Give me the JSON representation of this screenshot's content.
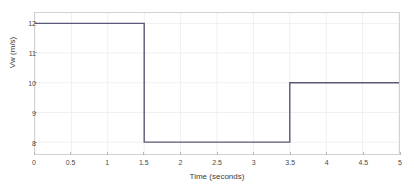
{
  "chart_data": {
    "type": "line",
    "title": "",
    "subtitle": "",
    "xlabel": "Time (seconds)",
    "ylabel": "Vw (m/s)",
    "xlim": [
      0,
      5
    ],
    "ylim": [
      7.6,
      12.35
    ],
    "xticks": [
      0,
      0.5,
      1,
      1.5,
      2,
      2.5,
      3,
      3.5,
      4,
      4.5,
      5
    ],
    "xticklabels": [
      "0",
      "0.5",
      "1",
      "1.5",
      "2",
      "2.5",
      "3",
      "3.5",
      "4",
      "4.5",
      "5"
    ],
    "yticks": [
      8,
      9,
      10,
      11,
      12
    ],
    "yticklabels": [
      "8",
      "9",
      "10",
      "11",
      "12"
    ],
    "grid": true,
    "legend": null,
    "annotations": [],
    "series": [
      {
        "name": "Vw",
        "style": "step",
        "color": "#5a5a78",
        "linewidth": 1.4,
        "x": [
          0,
          1.5,
          1.5,
          3.5,
          3.5,
          5
        ],
        "y": [
          12,
          12,
          8,
          8,
          10,
          10
        ],
        "segments": [
          {
            "t_start": 0,
            "t_end": 1.5,
            "value": 12
          },
          {
            "t_start": 1.5,
            "t_end": 3.5,
            "value": 8
          },
          {
            "t_start": 3.5,
            "t_end": 5,
            "value": 10
          }
        ]
      }
    ]
  },
  "style": {
    "line_color": "#5a5a78",
    "grid_color": "#f0f0f0",
    "axis_color": "#d2d2d2",
    "tick_color": "#b8b8b8",
    "text_color": "#4a4a4a",
    "background": "#ffffff"
  }
}
